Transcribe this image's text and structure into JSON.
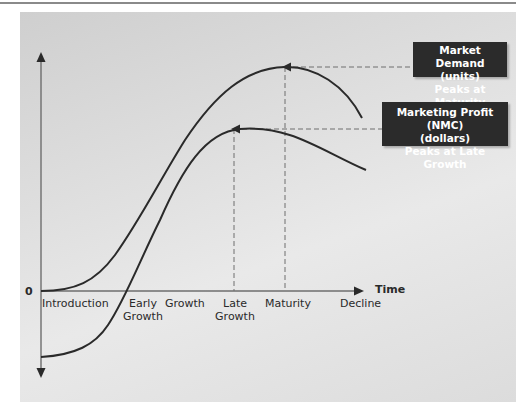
{
  "diagram": {
    "axis": {
      "zero_label": "0",
      "x_axis_label": "Time"
    },
    "stages": [
      {
        "label": "Introduction"
      },
      {
        "label": "Early\nGrowth"
      },
      {
        "label": "Growth"
      },
      {
        "label": "Late\nGrowth"
      },
      {
        "label": "Maturity"
      },
      {
        "label": "Decline"
      }
    ],
    "stage_lines": {
      "introduction": "Introduction",
      "early_1": "Early",
      "early_2": "Growth",
      "growth": "Growth",
      "late_1": "Late",
      "late_2": "Growth",
      "maturity": "Maturity",
      "decline": "Decline"
    },
    "callouts": {
      "market_demand": {
        "line1": "Market Demand",
        "line2": "(units)",
        "line3": "Peaks at Maturity"
      },
      "marketing_profit": {
        "line1": "Marketing Profit (NMC)",
        "line2": "(dollars)",
        "line3": "Peaks at Late Growth"
      }
    },
    "curves": [
      {
        "name": "Market Demand (units)",
        "peak_stage": "Maturity",
        "starts_at": "0"
      },
      {
        "name": "Marketing Profit (NMC) (dollars)",
        "peak_stage": "Late Growth",
        "starts_at": "negative"
      }
    ],
    "colors": {
      "curve": "#2a2a2a",
      "axis": "#6e6e6e",
      "dash": "#6e6e6e",
      "callout_bg": "#2b2b2b",
      "callout_text": "#ffffff",
      "panel": "#e2e2e2"
    }
  }
}
